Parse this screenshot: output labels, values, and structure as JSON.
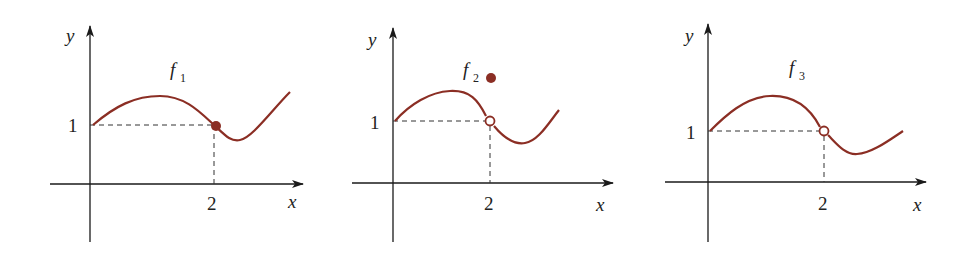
{
  "colors": {
    "curve": "#8b2e24",
    "axis": "#1a1a1a",
    "dash": "#333333"
  },
  "panels": [
    {
      "name": "f",
      "subscript": "1",
      "y_label": "y",
      "x_label": "x",
      "y_tick": "1",
      "x_tick": "2",
      "point_type": "filled-on-curve",
      "description": "continuous at x=2"
    },
    {
      "name": "f",
      "subscript": "2",
      "y_label": "y",
      "x_label": "x",
      "y_tick": "1",
      "x_tick": "2",
      "point_type": "hole-with-filled-above",
      "description": "removable discontinuity at x=2, value defined above"
    },
    {
      "name": "f",
      "subscript": "3",
      "y_label": "y",
      "x_label": "x",
      "y_tick": "1",
      "x_tick": "2",
      "point_type": "hole",
      "description": "undefined at x=2"
    }
  ]
}
